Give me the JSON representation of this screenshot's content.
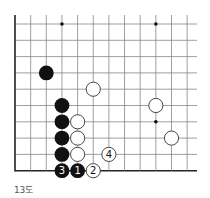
{
  "diagram": {
    "title": "13도",
    "board": {
      "origin_x": 15,
      "origin_y": 24,
      "col_spacing": 15.65,
      "row_spacing": 16.3,
      "cols": 12,
      "rows": 10,
      "right_extent": 197,
      "top_extent": 15,
      "left_edge": true,
      "bottom_edge": true,
      "line_color": "#888888",
      "edge_color": "#222222"
    },
    "star_points": [
      {
        "col": 3,
        "row": 0
      },
      {
        "col": 9,
        "row": 0
      },
      {
        "col": 9,
        "row": 6
      }
    ],
    "stones": [
      {
        "color": "black",
        "col": 2,
        "row": 3,
        "label": ""
      },
      {
        "color": "white",
        "col": 5,
        "row": 4,
        "label": ""
      },
      {
        "color": "black",
        "col": 3,
        "row": 5,
        "label": ""
      },
      {
        "color": "white",
        "col": 9,
        "row": 5,
        "label": ""
      },
      {
        "color": "black",
        "col": 3,
        "row": 6,
        "label": ""
      },
      {
        "color": "white",
        "col": 4,
        "row": 6,
        "label": ""
      },
      {
        "color": "black",
        "col": 3,
        "row": 7,
        "label": ""
      },
      {
        "color": "white",
        "col": 4,
        "row": 7,
        "label": ""
      },
      {
        "color": "white",
        "col": 10,
        "row": 7,
        "label": ""
      },
      {
        "color": "black",
        "col": 3,
        "row": 8,
        "label": ""
      },
      {
        "color": "white",
        "col": 4,
        "row": 8,
        "label": ""
      },
      {
        "color": "white",
        "col": 6,
        "row": 8,
        "label": "4"
      },
      {
        "color": "black",
        "col": 3,
        "row": 9,
        "label": "3"
      },
      {
        "color": "black",
        "col": 4,
        "row": 9,
        "label": "1"
      },
      {
        "color": "white",
        "col": 5,
        "row": 9,
        "label": "2"
      }
    ]
  }
}
